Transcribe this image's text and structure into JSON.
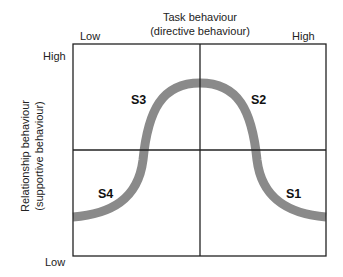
{
  "diagram": {
    "x_axis": {
      "title_line1": "Task behaviour",
      "title_line2": "(directive behaviour)",
      "low_label": "Low",
      "high_label": "High"
    },
    "y_axis": {
      "title_line1": "Relationship behaviour",
      "title_line2": "(supportive behaviour)",
      "high_label": "High",
      "low_label": "Low"
    },
    "quadrants": [
      {
        "id": "S1",
        "label": "S1",
        "position": "bottom-right"
      },
      {
        "id": "S2",
        "label": "S2",
        "position": "top-right"
      },
      {
        "id": "S3",
        "label": "S3",
        "position": "top-left"
      },
      {
        "id": "S4",
        "label": "S4",
        "position": "bottom-left"
      }
    ],
    "curve": {
      "description": "bell-shaped curve from low-left through peak at top-center to low-right",
      "color": "#8a8a8a"
    },
    "colors": {
      "grid_line": "#222222",
      "curve": "#8a8a8a",
      "background": "#ffffff"
    }
  }
}
